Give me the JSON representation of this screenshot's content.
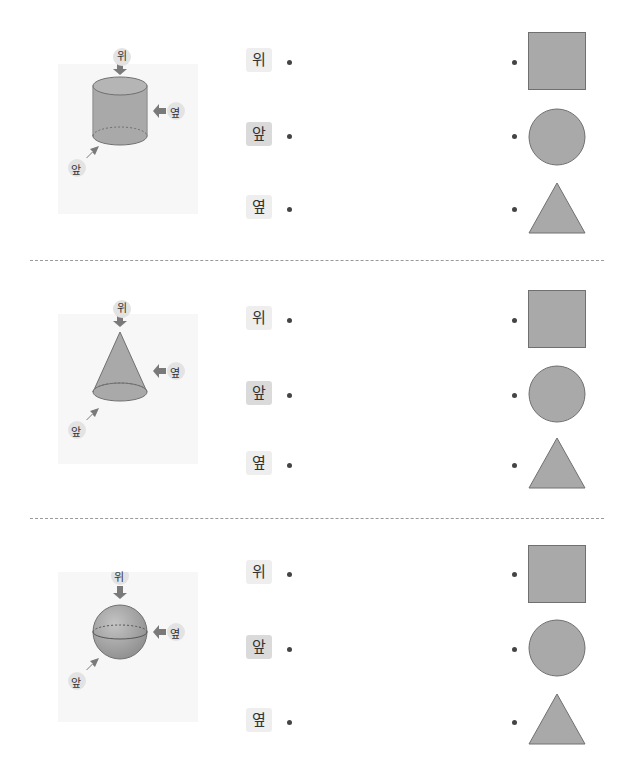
{
  "colors": {
    "shape_fill": "#a9a9a9",
    "shape_stroke": "#707070",
    "arrow": "#7a7a7a",
    "label_bg": "#eeeeee",
    "label_bg_front": "#dadada",
    "divider": "#9a9a9a"
  },
  "sections": [
    {
      "solid": "cylinder",
      "figure_labels": {
        "top": "위",
        "side": "옆",
        "front": "앞"
      },
      "views": [
        {
          "label": "위"
        },
        {
          "label": "앞"
        },
        {
          "label": "옆"
        }
      ],
      "shapes": [
        {
          "kind": "square"
        },
        {
          "kind": "circle"
        },
        {
          "kind": "triangle"
        }
      ]
    },
    {
      "solid": "cone",
      "figure_labels": {
        "top": "위",
        "side": "옆",
        "front": "앞"
      },
      "views": [
        {
          "label": "위"
        },
        {
          "label": "앞"
        },
        {
          "label": "옆"
        }
      ],
      "shapes": [
        {
          "kind": "square"
        },
        {
          "kind": "circle"
        },
        {
          "kind": "triangle"
        }
      ]
    },
    {
      "solid": "sphere",
      "figure_labels": {
        "top": "위",
        "side": "옆",
        "front": "앞"
      },
      "views": [
        {
          "label": "위"
        },
        {
          "label": "앞"
        },
        {
          "label": "옆"
        }
      ],
      "shapes": [
        {
          "kind": "square"
        },
        {
          "kind": "circle"
        },
        {
          "kind": "triangle"
        }
      ]
    }
  ]
}
